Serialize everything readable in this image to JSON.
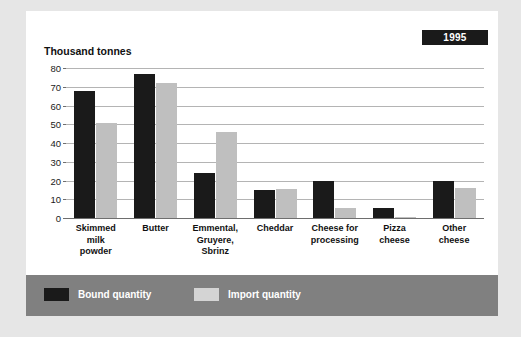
{
  "badge": {
    "year": "1995"
  },
  "legend": {
    "position": "bottom",
    "items": [
      {
        "label": "Bound quantity",
        "color": "#1a1a1a",
        "key": "bound"
      },
      {
        "label": "Import quantity",
        "color": "#d4d4d4",
        "key": "import"
      }
    ]
  },
  "chart_data": {
    "type": "bar",
    "title": "",
    "subtitle": "",
    "xlabel": "",
    "ylabel": "Thousand tonnes",
    "ylim": [
      0,
      80
    ],
    "yticks": [
      0,
      10,
      20,
      30,
      40,
      50,
      60,
      70,
      80
    ],
    "ytick_labels": [
      "0",
      "10",
      "20",
      "30",
      "40",
      "50",
      "60",
      "70",
      "80"
    ],
    "grid": true,
    "grid_axis": "y",
    "legend_position": "bottom",
    "annotations": [
      "1995"
    ],
    "categories": [
      "Skimmed milk powder",
      "Butter",
      "Emmental, Gruyere, Sbrinz",
      "Cheddar",
      "Cheese for processing",
      "Pizza cheese",
      "Other cheese"
    ],
    "category_lines": [
      [
        "Skimmed",
        "milk",
        "powder"
      ],
      [
        "Butter"
      ],
      [
        "Emmental,",
        "Gruyere,",
        "Sbrinz"
      ],
      [
        "Cheddar"
      ],
      [
        "Cheese for",
        "processing"
      ],
      [
        "Pizza",
        "cheese"
      ],
      [
        "Other",
        "cheese"
      ]
    ],
    "series": [
      {
        "name": "Bound quantity",
        "color": "#1a1a1a",
        "values": [
          68,
          77,
          24,
          15,
          20,
          5.5,
          20
        ]
      },
      {
        "name": "Import quantity",
        "color": "#bfbfbf",
        "values": [
          50.5,
          72,
          46,
          15.5,
          5.5,
          0.5,
          16
        ]
      }
    ]
  }
}
